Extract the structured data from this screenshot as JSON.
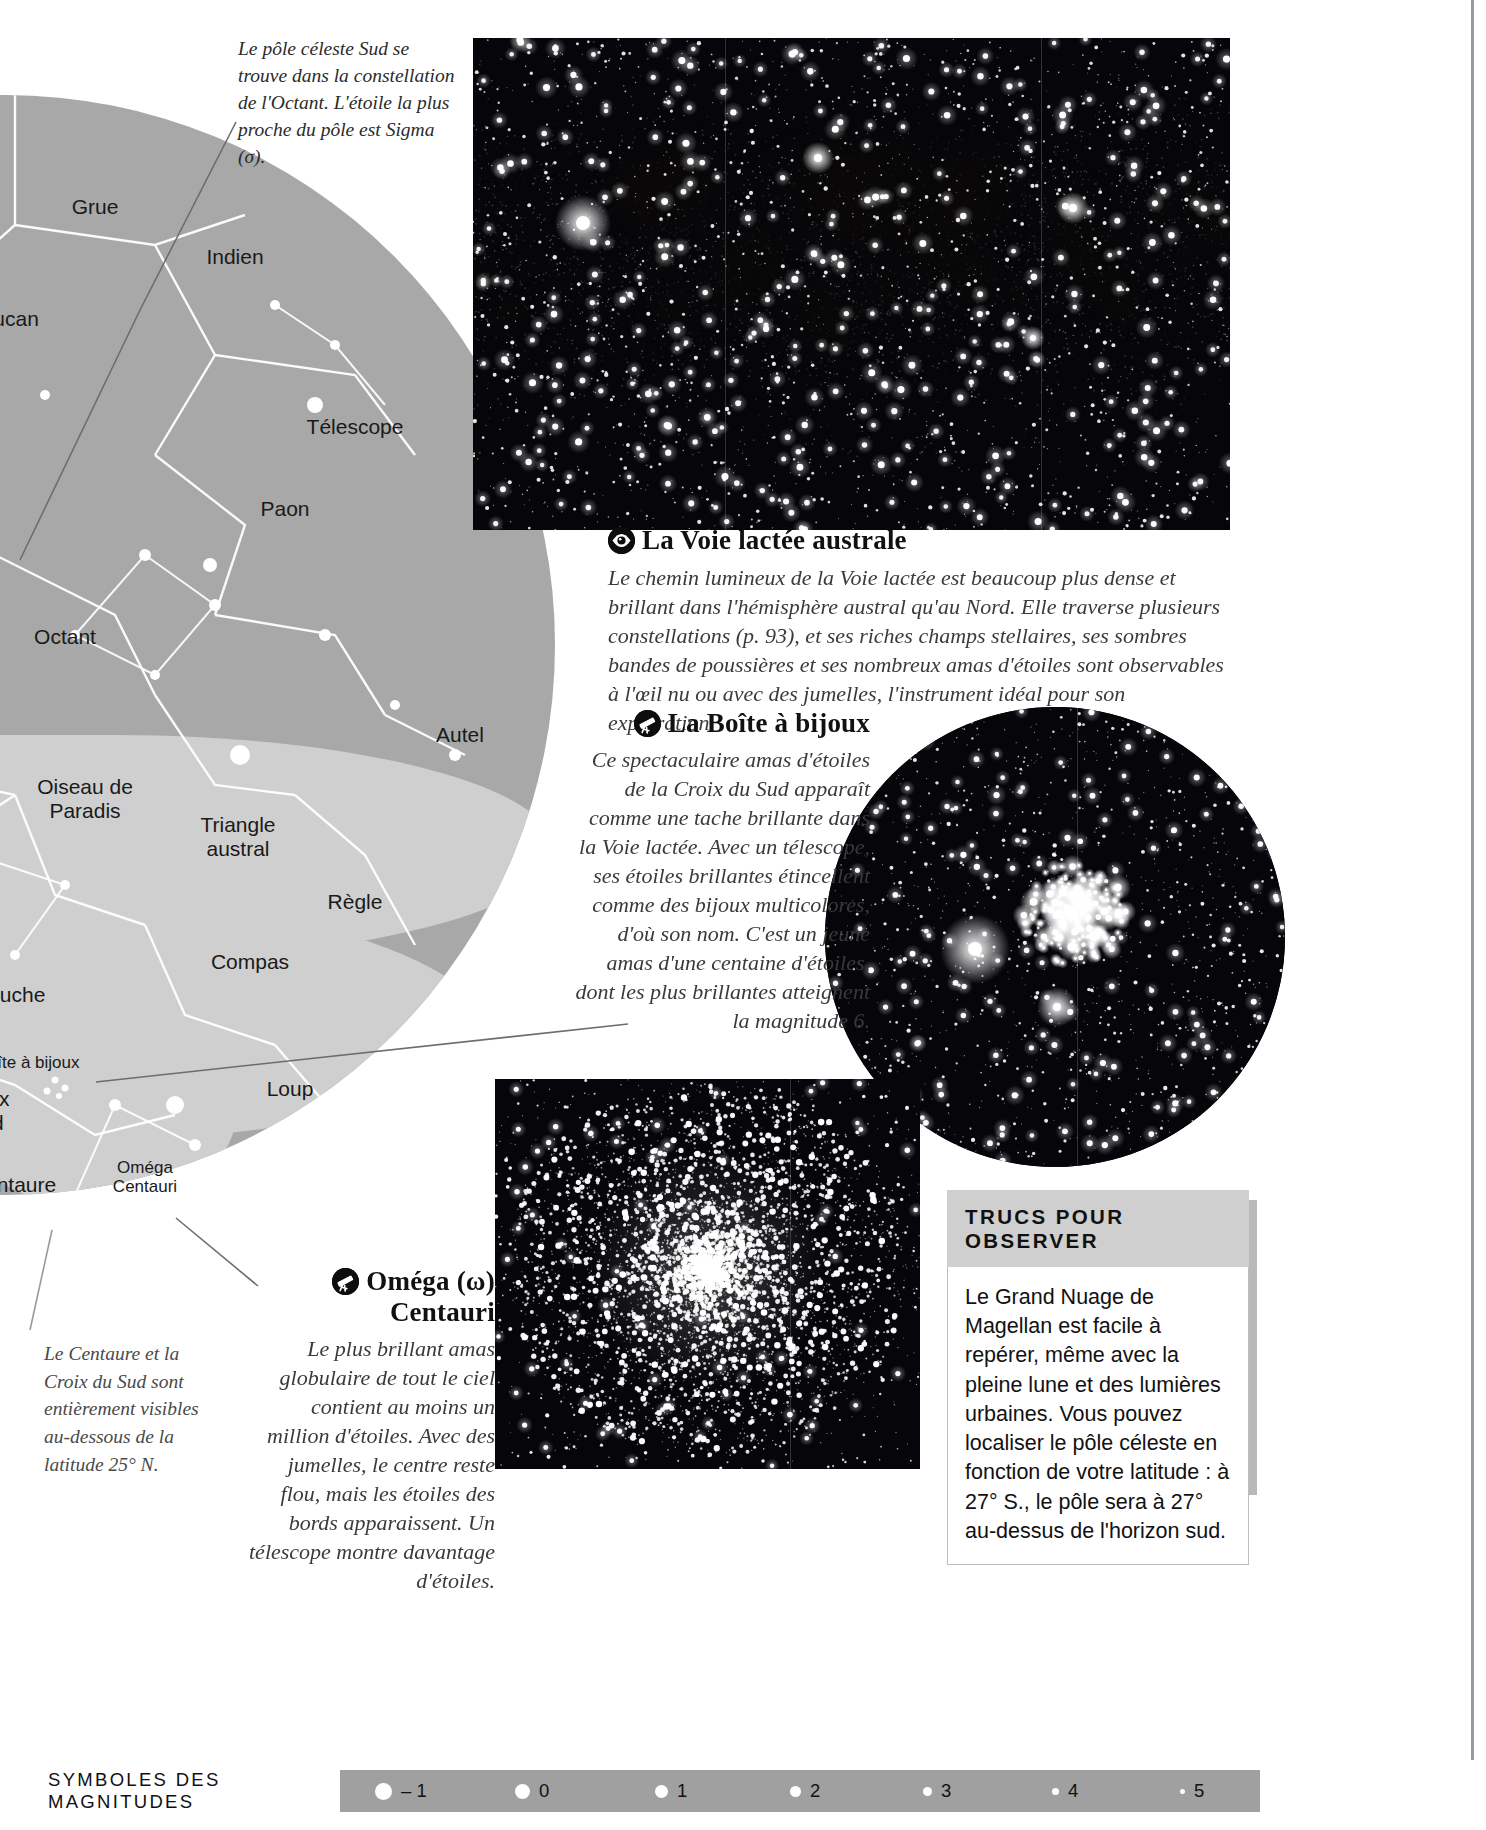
{
  "top_note": "Le pôle céleste Sud se trouve dans la constellation de l'Octant. L'étoile la plus proche du pôle est Sigma (σ).",
  "bottom_note": "Le Centaure et la Croix du Sud sont entièrement visibles au-dessous de la latitude 25° N.",
  "starmap": {
    "labels": [
      {
        "text": "Grue",
        "x": 640,
        "y": 100,
        "size": 21
      },
      {
        "text": "Indien",
        "x": 780,
        "y": 150,
        "size": 21
      },
      {
        "text": "Toucan",
        "x": 550,
        "y": 212,
        "size": 21
      },
      {
        "text": "Télescope",
        "x": 900,
        "y": 320,
        "size": 21
      },
      {
        "text": "Paon",
        "x": 830,
        "y": 402,
        "size": 21
      },
      {
        "text": "Octant",
        "x": 610,
        "y": 530,
        "size": 21
      },
      {
        "text": "Autel",
        "x": 1005,
        "y": 628,
        "size": 21
      },
      {
        "text": "Oiseau de\nParadis",
        "x": 630,
        "y": 680,
        "size": 21
      },
      {
        "text": "Triangle\naustral",
        "x": 783,
        "y": 718,
        "size": 21
      },
      {
        "text": "Règle",
        "x": 900,
        "y": 795,
        "size": 21
      },
      {
        "text": "Mouche",
        "x": 553,
        "y": 888,
        "size": 21
      },
      {
        "text": "Compas",
        "x": 795,
        "y": 855,
        "size": 21
      },
      {
        "text": "Boîte à bijoux",
        "x": 573,
        "y": 958,
        "size": 17
      },
      {
        "text": "Loup",
        "x": 835,
        "y": 982,
        "size": 21
      },
      {
        "text": "Croix\nSud",
        "x": 530,
        "y": 992,
        "size": 21
      },
      {
        "text": "Centaure",
        "x": 558,
        "y": 1078,
        "size": 21
      },
      {
        "text": "Oméga\nCentauri",
        "x": 690,
        "y": 1063,
        "size": 17
      }
    ]
  },
  "milky_way": {
    "icon": "eye-icon",
    "title": "La Voie lactée australe",
    "body": "Le chemin lumineux de la Voie lactée est beaucoup plus dense et brillant dans l'hémisphère austral qu'au Nord. Elle traverse plusieurs constellations (p. 93), et ses riches champs stellaires, ses sombres bandes de poussières et ses nombreux amas d'étoiles sont observables à l'œil nu ou avec des jumelles, l'instrument idéal pour son exploration."
  },
  "jewel_box": {
    "icon": "telescope-icon",
    "title": "La Boîte à bijoux",
    "body": "Ce spectaculaire amas d'étoiles de la Croix du Sud apparaît comme une tache brillante dans la Voie lactée. Avec un télescope, ses étoiles brillantes étincellent comme des bijoux multicolores, d'où son nom. C'est un jeune amas d'une centaine d'étoiles, dont les plus brillantes atteignent la magnitude 6."
  },
  "omega_centauri": {
    "icon": "telescope-icon",
    "title": "Oméga (ω) Centauri",
    "body": "Le plus brillant amas globulaire de tout le ciel contient au moins un million d'étoiles. Avec des jumelles, le centre reste flou, mais les étoiles des bords apparaissent. Un télescope montre davantage d'étoiles."
  },
  "tips": {
    "heading": "TRUCS POUR OBSERVER",
    "body": "Le Grand Nuage de Magellan est facile à repérer, même avec la pleine lune et des lumières urbaines. Vous pouvez localiser le pôle céleste en fonction de votre latitude : à 27° S., le pôle sera à 27° au-dessus de l'horizon sud."
  },
  "magnitudes_legend": {
    "label": "SYMBOLES DES MAGNITUDES",
    "items": [
      {
        "value": "– 1",
        "x": 345,
        "size": 17
      },
      {
        "value": "0",
        "x": 485,
        "size": 15
      },
      {
        "value": "1",
        "x": 625,
        "size": 13
      },
      {
        "value": "2",
        "x": 760,
        "size": 11
      },
      {
        "value": "3",
        "x": 893,
        "size": 9
      },
      {
        "value": "4",
        "x": 1022,
        "size": 7
      },
      {
        "value": "5",
        "x": 1150,
        "size": 5
      }
    ]
  },
  "colors": {
    "map_fill": "#a8a8a8",
    "milkyway_band": "#cfcfcf",
    "legend_bar": "#a0a0a0",
    "tips_header": "#cfcfcf"
  }
}
